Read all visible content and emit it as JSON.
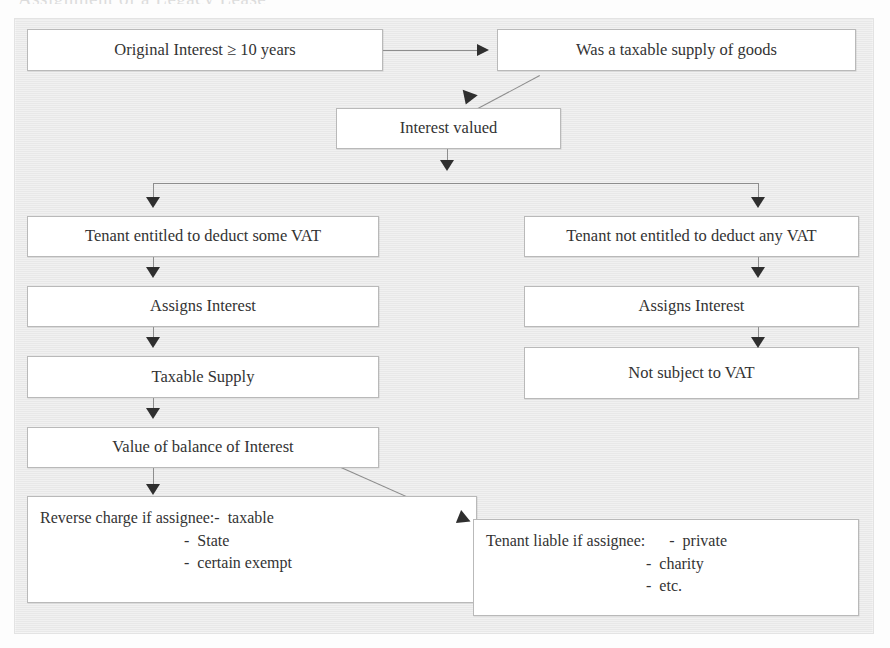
{
  "document": {
    "cut_off_heading": "Assignment of a Legacy Lease",
    "background_color": "#ebebeb",
    "box_fill_color": "#ffffff",
    "box_border_color": "#b9b9b9",
    "arrow_color": "#2f2f2f"
  },
  "nodes": {
    "original_interest": "Original Interest ≥ 10 years",
    "taxable_supply_goods": "Was a taxable supply of goods",
    "interest_valued": "Interest valued",
    "tenant_entitled": "Tenant entitled to deduct some VAT",
    "tenant_not_entitled": "Tenant not entitled to deduct any VAT",
    "assigns_interest_left": "Assigns Interest",
    "assigns_interest_right": "Assigns Interest",
    "taxable_supply": "Taxable Supply",
    "not_subject_vat": "Not subject to VAT",
    "value_balance": "Value of balance of Interest",
    "reverse_charge": {
      "line1": "Reverse charge if assignee:-  taxable",
      "line2": "                                    -  State",
      "line3": "                                    -  certain exempt"
    },
    "tenant_liable": {
      "line1": "Tenant liable if assignee:      -  private",
      "line2": "                                        -  charity",
      "line3": "                                        -  etc."
    }
  },
  "edges": {
    "e1_label": "original-interest-to-taxable-supply-of-goods",
    "e2_label": "taxable-supply-of-goods-to-interest-valued",
    "e3_label": "interest-valued-split",
    "e4_label": "interest-valued-to-tenant-entitled",
    "e5_label": "interest-valued-to-tenant-not-entitled",
    "e6_label": "tenant-entitled-to-assigns-interest",
    "e7_label": "assigns-interest-to-taxable-supply",
    "e8_label": "taxable-supply-to-value-of-balance",
    "e9_label": "value-of-balance-to-reverse-charge",
    "e10_label": "value-of-balance-to-tenant-liable",
    "e11_label": "tenant-not-entitled-to-assigns-interest",
    "e12_label": "assigns-interest-to-not-subject-to-vat"
  }
}
